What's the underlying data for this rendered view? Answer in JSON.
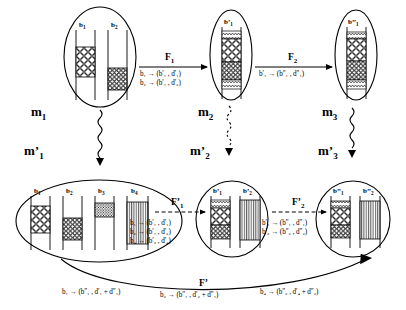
{
  "diagram": {
    "ink_color": "#000000"
  },
  "modules": [
    {
      "id": "m1",
      "label": "m",
      "sub": "1",
      "prime": "",
      "bars": [
        {
          "label": "b",
          "sub": "1",
          "prime": "",
          "pattern": "circles",
          "fill_top": 28,
          "fill_height": 34
        },
        {
          "label": "b",
          "sub": "2",
          "prime": "",
          "pattern": "circles-small",
          "fill_top": 50,
          "fill_height": 24
        }
      ]
    },
    {
      "id": "m2",
      "label": "m",
      "sub": "2",
      "prime": "",
      "bars": [
        {
          "label": "b",
          "sub": "1",
          "prime": "'",
          "pattern": "stacked",
          "fill_top": 10,
          "fill_height": 70
        }
      ]
    },
    {
      "id": "m3",
      "label": "m",
      "sub": "3",
      "prime": "",
      "bars": [
        {
          "label": "b",
          "sub": "1",
          "prime": "''",
          "pattern": "stacked",
          "fill_top": 12,
          "fill_height": 66
        }
      ]
    },
    {
      "id": "m1p",
      "label": "m",
      "sub": "1",
      "prime": "'",
      "bars": [
        {
          "label": "b",
          "sub": "1",
          "prime": "",
          "pattern": "circles",
          "fill_top": 20,
          "fill_height": 30
        },
        {
          "label": "b",
          "sub": "2",
          "prime": "",
          "pattern": "circles-small",
          "fill_top": 36,
          "fill_height": 24
        },
        {
          "label": "b",
          "sub": "3",
          "prime": "",
          "pattern": "dots",
          "fill_top": 12,
          "fill_height": 16
        },
        {
          "label": "b",
          "sub": "4",
          "prime": "",
          "pattern": "vstripes",
          "fill_top": 10,
          "fill_height": 46
        }
      ]
    },
    {
      "id": "m2p",
      "label": "m",
      "sub": "2",
      "prime": "'",
      "bars": [
        {
          "label": "b",
          "sub": "1",
          "prime": "'",
          "pattern": "circles",
          "fill_top": 8,
          "fill_height": 48
        },
        {
          "label": "b",
          "sub": "2",
          "prime": "'",
          "pattern": "vstripes",
          "fill_top": 6,
          "fill_height": 50
        }
      ]
    },
    {
      "id": "m3p",
      "label": "m",
      "sub": "3",
      "prime": "'",
      "bars": [
        {
          "label": "b",
          "sub": "1",
          "prime": "''",
          "pattern": "circles",
          "fill_top": 8,
          "fill_height": 46
        },
        {
          "label": "b",
          "sub": "2",
          "prime": "''",
          "pattern": "vstripes",
          "fill_top": 8,
          "fill_height": 46
        }
      ]
    }
  ],
  "arrows": {
    "f1": {
      "name": "F",
      "sub": "1",
      "prime": "",
      "style": "solid",
      "mappings": [
        "b₁ → (b′₁ , d′₁)",
        "b₂ → (b′₁ , d′₂)"
      ]
    },
    "f2": {
      "name": "F",
      "sub": "2",
      "prime": "",
      "style": "solid",
      "mappings": [
        "b′₁ → (b″₁ , d″₁)"
      ]
    },
    "f1p": {
      "name": "F",
      "sub": "1",
      "prime": "'",
      "style": "dashed",
      "mappings": [
        "b₁ → (b′₁ , d′₁)",
        "b₂ → (b′₁ , d′₂)",
        "b₄ → (b′₂ , d′₄)"
      ]
    },
    "f2p": {
      "name": "F",
      "sub": "2",
      "prime": "'",
      "style": "dashed",
      "mappings": [
        "b′₁ → (b″₁ , d″₁)",
        "b′₂ → (b″₂ , d″₂)"
      ]
    },
    "fp": {
      "name": "F",
      "sub": "",
      "prime": "'",
      "style": "curve",
      "mappings": [
        "b₁ → (b″₁ , d′₁ + d″₁)",
        "b₂ → (b″₁ , d′₂ + d″₁)",
        "b₄ → (b″₂ , d′₄ + d″₂)"
      ]
    }
  },
  "refinements": [
    {
      "from": "m1",
      "to": "m1p",
      "style": "squiggly-arrow"
    },
    {
      "from": "m2",
      "to": "m2p",
      "style": "squiggly-dotted-arrow"
    },
    {
      "from": "m3",
      "to": "m3p",
      "style": "squiggly-arrow"
    }
  ]
}
